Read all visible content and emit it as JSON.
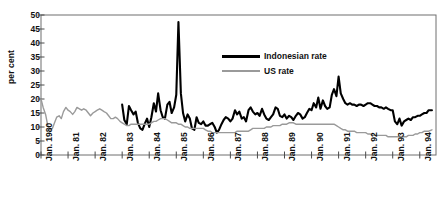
{
  "chart_data": {
    "type": "line",
    "title": "",
    "subtitle": "",
    "xlabel": "",
    "ylabel": "per cent",
    "ylim": [
      0,
      50
    ],
    "ytick_values": [
      0,
      5,
      10,
      15,
      20,
      25,
      30,
      35,
      40,
      45,
      50
    ],
    "ytick_labels": [
      "0",
      "5",
      "10",
      "15",
      "20",
      "25",
      "30",
      "35",
      "40",
      "45",
      "50"
    ],
    "grid": false,
    "legend_position": "upper-center-right",
    "xlim": [
      1980.0,
      1994.6
    ],
    "xtick_values": [
      1980,
      1981,
      1982,
      1983,
      1984,
      1985,
      1986,
      1987,
      1988,
      1989,
      1990,
      1991,
      1992,
      1993,
      1994
    ],
    "xtick_labels": [
      "Jan. 1980",
      "Jan. 81",
      "Jan. 82",
      "Jan. 83",
      "Jan. 84",
      "Jan. 85",
      "Jan. 86",
      "Jan. 87",
      "Jan. 88",
      "Jan. 89",
      "Jan. 90",
      "Jan. 91",
      "Jan. 92",
      "Jan. 93",
      "Jan. 94"
    ],
    "series": [
      {
        "name": "Indonesian rate",
        "color": "#000000",
        "linewidth": 2.1,
        "x": [
          1983.0,
          1983.08,
          1983.17,
          1983.25,
          1983.33,
          1983.42,
          1983.5,
          1983.58,
          1983.67,
          1983.75,
          1983.83,
          1983.92,
          1984.0,
          1984.08,
          1984.17,
          1984.25,
          1984.33,
          1984.42,
          1984.5,
          1984.58,
          1984.67,
          1984.75,
          1984.83,
          1984.92,
          1985.0,
          1985.08,
          1985.17,
          1985.25,
          1985.33,
          1985.42,
          1985.5,
          1985.58,
          1985.67,
          1985.75,
          1985.83,
          1985.92,
          1986.0,
          1986.08,
          1986.17,
          1986.25,
          1986.33,
          1986.42,
          1986.5,
          1986.58,
          1986.67,
          1986.75,
          1986.83,
          1986.92,
          1987.0,
          1987.08,
          1987.17,
          1987.25,
          1987.33,
          1987.42,
          1987.5,
          1987.58,
          1987.67,
          1987.75,
          1987.83,
          1987.92,
          1988.0,
          1988.08,
          1988.17,
          1988.25,
          1988.33,
          1988.42,
          1988.5,
          1988.58,
          1988.67,
          1988.75,
          1988.83,
          1988.92,
          1989.0,
          1989.08,
          1989.17,
          1989.25,
          1989.33,
          1989.42,
          1989.5,
          1989.58,
          1989.67,
          1989.75,
          1989.83,
          1989.92,
          1990.0,
          1990.08,
          1990.17,
          1990.25,
          1990.33,
          1990.42,
          1990.5,
          1990.58,
          1990.67,
          1990.75,
          1990.83,
          1990.92,
          1991.0,
          1991.08,
          1991.17,
          1991.25,
          1991.33,
          1991.42,
          1991.5,
          1991.58,
          1991.67,
          1991.75,
          1991.83,
          1991.92,
          1992.0,
          1992.08,
          1992.17,
          1992.25,
          1992.33,
          1992.42,
          1992.5,
          1992.58,
          1992.67,
          1992.75,
          1992.83,
          1992.92,
          1993.0,
          1993.08,
          1993.17,
          1993.25,
          1993.33,
          1993.42,
          1993.5,
          1993.58,
          1993.67,
          1993.75,
          1993.83,
          1993.92,
          1994.0,
          1994.08,
          1994.17,
          1994.25,
          1994.33,
          1994.45
        ],
        "y": [
          18.0,
          12.5,
          11.0,
          17.5,
          16.0,
          14.5,
          15.5,
          11.5,
          9.5,
          9.0,
          11.0,
          13.0,
          10.0,
          13.5,
          18.5,
          15.5,
          22.0,
          16.0,
          13.5,
          13.0,
          18.0,
          19.0,
          15.0,
          17.0,
          21.5,
          47.5,
          22.0,
          15.0,
          12.0,
          14.5,
          13.0,
          9.5,
          9.0,
          13.5,
          11.5,
          11.0,
          12.0,
          10.5,
          10.5,
          11.0,
          11.5,
          10.0,
          8.0,
          9.0,
          11.0,
          12.5,
          13.5,
          13.0,
          12.0,
          13.0,
          16.0,
          14.5,
          15.5,
          13.0,
          13.5,
          12.0,
          16.0,
          17.0,
          15.5,
          14.5,
          15.0,
          14.0,
          16.5,
          14.5,
          13.0,
          12.5,
          13.5,
          14.5,
          17.0,
          16.5,
          14.0,
          13.5,
          14.5,
          13.0,
          14.0,
          13.5,
          12.5,
          14.0,
          15.0,
          14.5,
          13.0,
          13.5,
          15.0,
          16.5,
          16.0,
          18.5,
          17.0,
          20.5,
          16.5,
          19.5,
          17.5,
          16.5,
          17.0,
          21.5,
          23.5,
          21.0,
          28.0,
          22.0,
          20.0,
          18.5,
          18.0,
          18.5,
          18.0,
          18.0,
          17.5,
          18.0,
          18.0,
          17.5,
          18.0,
          18.5,
          18.5,
          18.0,
          17.5,
          17.5,
          17.0,
          17.0,
          16.5,
          17.0,
          16.5,
          16.0,
          16.0,
          12.0,
          11.0,
          13.0,
          10.5,
          12.0,
          12.5,
          13.0,
          12.5,
          13.5,
          13.5,
          14.0,
          14.0,
          14.5,
          15.0,
          15.0,
          16.0,
          16.0
        ]
      },
      {
        "name": "US rate",
        "color": "#9a9a9a",
        "linewidth": 1.4,
        "x": [
          1980.0,
          1980.08,
          1980.17,
          1980.25,
          1980.33,
          1980.42,
          1980.5,
          1980.58,
          1980.67,
          1980.75,
          1980.83,
          1980.92,
          1981.0,
          1981.08,
          1981.17,
          1981.25,
          1981.33,
          1981.42,
          1981.5,
          1981.58,
          1981.67,
          1981.75,
          1981.83,
          1981.92,
          1982.0,
          1982.08,
          1982.17,
          1982.25,
          1982.33,
          1982.42,
          1982.5,
          1982.58,
          1982.67,
          1982.75,
          1982.83,
          1982.92,
          1983.0,
          1983.08,
          1983.17,
          1983.25,
          1983.33,
          1983.42,
          1983.5,
          1983.58,
          1983.67,
          1983.75,
          1983.83,
          1983.92,
          1984.0,
          1984.08,
          1984.17,
          1984.25,
          1984.33,
          1984.42,
          1984.5,
          1984.58,
          1984.67,
          1984.75,
          1984.83,
          1984.92,
          1985.0,
          1985.08,
          1985.17,
          1985.25,
          1985.33,
          1985.42,
          1985.5,
          1985.58,
          1985.67,
          1985.75,
          1985.83,
          1985.92,
          1986.0,
          1986.08,
          1986.17,
          1986.25,
          1986.33,
          1986.42,
          1986.5,
          1986.58,
          1986.67,
          1986.75,
          1986.83,
          1986.92,
          1987.0,
          1987.08,
          1987.17,
          1987.25,
          1987.33,
          1987.42,
          1987.5,
          1987.58,
          1987.67,
          1987.75,
          1987.83,
          1987.92,
          1988.0,
          1988.08,
          1988.17,
          1988.25,
          1988.33,
          1988.42,
          1988.5,
          1988.58,
          1988.67,
          1988.75,
          1988.83,
          1988.92,
          1989.0,
          1989.08,
          1989.17,
          1989.25,
          1989.33,
          1989.42,
          1989.5,
          1989.58,
          1989.67,
          1989.75,
          1989.83,
          1989.92,
          1990.0,
          1990.08,
          1990.17,
          1990.25,
          1990.33,
          1990.42,
          1990.5,
          1990.58,
          1990.67,
          1990.75,
          1990.83,
          1990.92,
          1991.0,
          1991.08,
          1991.17,
          1991.25,
          1991.33,
          1991.42,
          1991.5,
          1991.58,
          1991.67,
          1991.75,
          1991.83,
          1991.92,
          1992.0,
          1992.08,
          1992.17,
          1992.25,
          1992.33,
          1992.42,
          1992.5,
          1992.58,
          1992.67,
          1992.75,
          1992.83,
          1992.92,
          1993.0,
          1993.08,
          1993.17,
          1993.25,
          1993.33,
          1993.42,
          1993.5,
          1993.58,
          1993.67,
          1993.75,
          1993.83,
          1993.92,
          1994.0,
          1994.08,
          1994.17,
          1994.25,
          1994.33,
          1994.45
        ],
        "y": [
          20.0,
          17.0,
          14.5,
          10.5,
          9.0,
          9.5,
          11.5,
          13.5,
          14.0,
          13.0,
          15.5,
          17.0,
          16.0,
          15.5,
          14.5,
          15.5,
          17.0,
          16.5,
          16.0,
          16.5,
          16.0,
          15.0,
          14.0,
          15.0,
          15.5,
          16.0,
          16.5,
          16.0,
          15.5,
          15.0,
          14.0,
          13.0,
          13.0,
          13.5,
          13.0,
          12.0,
          11.5,
          11.0,
          10.5,
          10.5,
          11.0,
          11.0,
          11.0,
          11.0,
          11.0,
          11.0,
          11.0,
          11.0,
          11.0,
          11.5,
          12.0,
          12.0,
          12.5,
          13.0,
          13.0,
          13.0,
          12.5,
          12.0,
          11.5,
          11.5,
          11.5,
          11.0,
          11.0,
          10.5,
          10.0,
          10.0,
          9.5,
          9.5,
          9.5,
          9.5,
          9.5,
          9.5,
          9.5,
          9.0,
          8.5,
          8.5,
          8.0,
          8.0,
          8.0,
          8.0,
          8.0,
          8.0,
          8.0,
          8.0,
          8.0,
          8.0,
          8.0,
          8.5,
          8.5,
          8.5,
          8.5,
          8.5,
          8.5,
          9.0,
          9.5,
          9.5,
          9.5,
          9.5,
          9.5,
          9.5,
          10.0,
          10.0,
          10.0,
          10.5,
          10.5,
          10.5,
          10.5,
          11.0,
          11.0,
          11.0,
          11.5,
          11.5,
          11.5,
          11.0,
          11.0,
          11.0,
          11.0,
          11.0,
          11.0,
          11.0,
          11.0,
          11.0,
          11.0,
          11.0,
          11.0,
          11.0,
          11.0,
          11.0,
          11.0,
          11.0,
          11.0,
          10.5,
          10.0,
          9.5,
          9.0,
          9.0,
          8.5,
          8.5,
          8.5,
          8.5,
          8.0,
          8.0,
          8.0,
          8.0,
          8.0,
          7.5,
          7.5,
          7.0,
          7.0,
          7.0,
          7.0,
          7.0,
          7.0,
          7.0,
          6.5,
          6.5,
          6.5,
          6.5,
          6.5,
          6.5,
          6.5,
          6.5,
          6.5,
          7.0,
          7.0,
          7.0,
          7.5,
          7.5,
          8.0,
          8.0,
          8.5,
          8.5,
          8.5,
          9.0
        ]
      }
    ],
    "legend": [
      {
        "label": "Indonesian rate",
        "color": "#000000",
        "style": "thick"
      },
      {
        "label": "US rate",
        "color": "#9a9a9a",
        "style": "thin"
      }
    ]
  }
}
